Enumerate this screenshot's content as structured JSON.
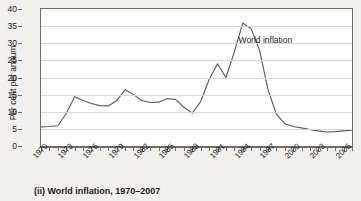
{
  "caption": "(ii) World inflation, 1970–2007",
  "annotation": "World inflation",
  "axis": {
    "y_title": "Per cent per annum"
  },
  "chart_data": {
    "type": "line",
    "title": "(ii) World inflation, 1970–2007",
    "xlabel": "",
    "ylabel": "Per cent per annum",
    "xlim": [
      1970,
      2007
    ],
    "ylim": [
      0,
      40
    ],
    "ytick_values": [
      0,
      5,
      10,
      15,
      20,
      25,
      30,
      35,
      40
    ],
    "ytick_labels": [
      "0",
      "5",
      "10",
      "15",
      "20",
      "25",
      "30",
      "35",
      "40"
    ],
    "xtick_values": [
      1970,
      1971,
      1972,
      1973,
      1974,
      1975,
      1976,
      1977,
      1978,
      1979,
      1980,
      1981,
      1982,
      1983,
      1984,
      1985,
      1986,
      1987,
      1988,
      1989,
      1990,
      1991,
      1992,
      1993,
      1994,
      1995,
      1996,
      1997,
      1998,
      1999,
      2000,
      2001,
      2002,
      2003,
      2004,
      2005,
      2006,
      2007
    ],
    "xtick_labeled": [
      1970,
      1973,
      1976,
      1979,
      1982,
      1985,
      1988,
      1991,
      1994,
      1997,
      2000,
      2003,
      2006
    ],
    "xtick_labels": [
      "1970",
      "1973",
      "1976",
      "1979",
      "1982",
      "1985",
      "1988",
      "1991",
      "1994",
      "1997",
      "2000",
      "2003",
      "2006"
    ],
    "grid": true,
    "grid_axis": "y",
    "legend": false,
    "annotations": [
      {
        "text": "World inflation",
        "x": 1993.5,
        "y": 31.0
      }
    ],
    "series": [
      {
        "name": "World inflation",
        "color": "#5a5a5a",
        "x": [
          1970,
          1971,
          1972,
          1973,
          1974,
          1975,
          1976,
          1977,
          1978,
          1979,
          1980,
          1981,
          1982,
          1983,
          1984,
          1985,
          1986,
          1987,
          1988,
          1989,
          1990,
          1991,
          1992,
          1993,
          1994,
          1995,
          1996,
          1997,
          1998,
          1999,
          2000,
          2001,
          2002,
          2003,
          2004,
          2005,
          2006,
          2007
        ],
        "values": [
          5.6,
          5.7,
          5.9,
          9.5,
          14.4,
          13.3,
          12.4,
          11.8,
          11.7,
          13.2,
          16.5,
          15.0,
          13.3,
          12.7,
          12.8,
          13.8,
          13.6,
          11.3,
          9.6,
          13.0,
          19.4,
          24.0,
          20.0,
          27.5,
          35.9,
          34.2,
          28.0,
          16.5,
          9.3,
          6.5,
          5.7,
          5.3,
          4.8,
          4.4,
          4.1,
          4.2,
          4.4,
          4.6
        ]
      }
    ]
  }
}
